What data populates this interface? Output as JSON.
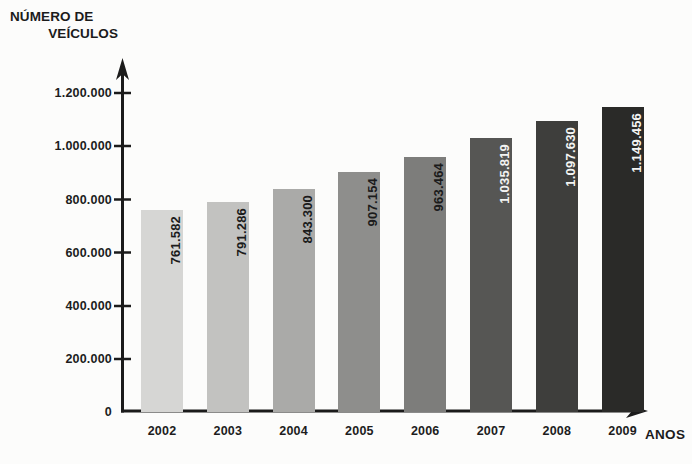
{
  "chart_data": {
    "type": "bar",
    "title": "",
    "ylabel": "NÚMERO DE VEÍCULOS",
    "ylabel_line1": "NÚMERO DE",
    "ylabel_line2": "VEÍCULOS",
    "xlabel": "ANOS",
    "categories": [
      "2002",
      "2003",
      "2004",
      "2005",
      "2006",
      "2007",
      "2008",
      "2009"
    ],
    "values": [
      761582,
      791286,
      843300,
      907154,
      963464,
      1035819,
      1097630,
      1149456
    ],
    "value_labels": [
      "761.582",
      "791.286",
      "843.300",
      "907.154",
      "963.464",
      "1.035.819",
      "1.097.630",
      "1.149.456"
    ],
    "bar_colors": [
      "#d6d6d4",
      "#c2c2c0",
      "#aaaaa8",
      "#8e8e8c",
      "#7d7d7b",
      "#565654",
      "#3e3e3c",
      "#2a2a28"
    ],
    "label_colors": [
      "#1b1b1b",
      "#1b1b1b",
      "#1b1b1b",
      "#1b1b1b",
      "#1b1b1b",
      "#f4f4f2",
      "#f4f4f2",
      "#f4f4f2"
    ],
    "ylim": [
      0,
      1200000
    ],
    "y_ticks": [
      0,
      200000,
      400000,
      600000,
      800000,
      1000000,
      1200000
    ],
    "y_tick_labels": [
      "0",
      "200.000",
      "400.000",
      "600.000",
      "800.000",
      "1.000.000",
      "1.200.000"
    ],
    "grid": false,
    "legend": "none",
    "axis_color": "#1b1b1b"
  }
}
